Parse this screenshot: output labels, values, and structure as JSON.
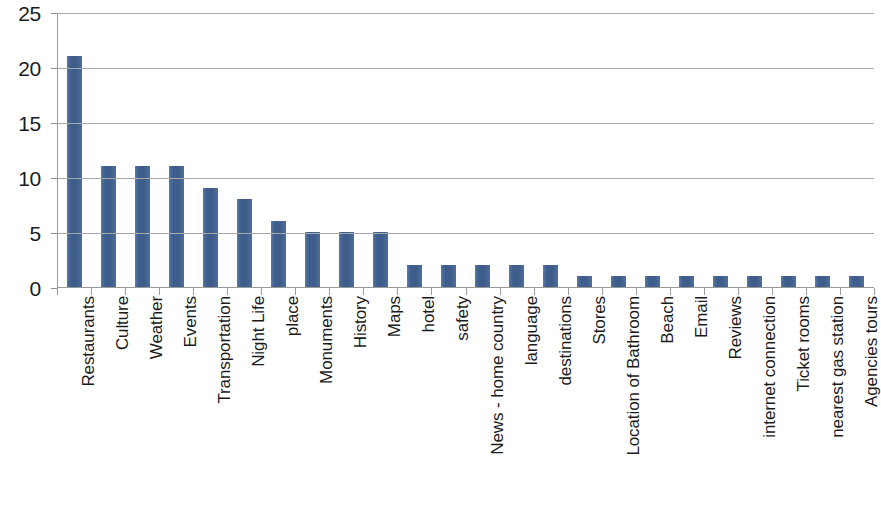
{
  "chart_data": {
    "type": "bar",
    "title": "",
    "subtitle": "",
    "xlabel": "",
    "ylabel": "",
    "ylim": [
      0,
      25
    ],
    "ytick_labels": [
      "0",
      "5",
      "10",
      "15",
      "20",
      "25"
    ],
    "ytick_values": [
      0,
      5,
      10,
      15,
      20,
      25
    ],
    "grid": true,
    "legend": false,
    "legend_position": "none",
    "bar_color": "#42628f",
    "gridline_color": "#a8a8a8",
    "axis_color": "#9a9a9a",
    "text_color": "#1b1b1b",
    "background_color": "#ffffff",
    "categories": [
      "Restaurants",
      "Culture",
      "Weather",
      "Events",
      "Transportation",
      "Night Life",
      "place",
      "Monuments",
      "History",
      "Maps",
      "hotel",
      "safety",
      "News - home country",
      "language",
      "destinations",
      "Stores",
      "Location of Bathroom",
      "Beach",
      "Email",
      "Reviews",
      "internet connection",
      "Ticket rooms",
      "nearest gas station",
      "Agencies tours"
    ],
    "values": [
      21,
      11,
      11,
      11,
      9,
      8,
      6,
      5,
      5,
      5,
      2,
      2,
      2,
      2,
      2,
      1,
      1,
      1,
      1,
      1,
      1,
      1,
      1,
      1
    ]
  }
}
